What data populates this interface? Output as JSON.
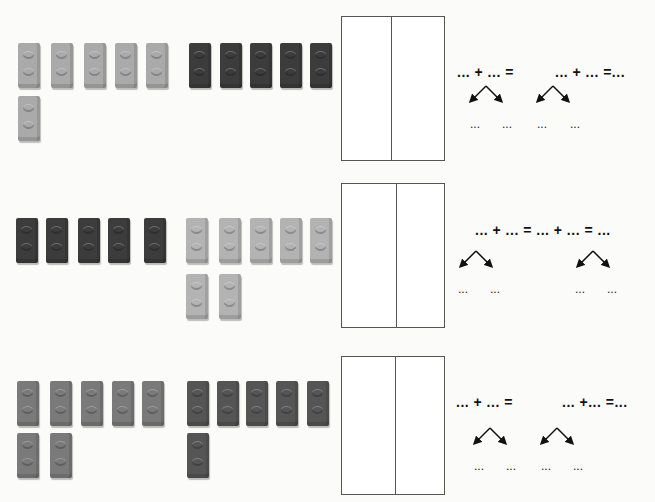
{
  "colors": {
    "light": "#aaaaaa",
    "dark": "#3c3c3c",
    "mid": "#7a7a7a",
    "mid_dark": "#555555",
    "light2": "#b3b3b3"
  },
  "exercises": [
    {
      "bricks": [
        {
          "x": 18,
          "y": 43,
          "c": "light"
        },
        {
          "x": 51,
          "y": 43,
          "c": "light"
        },
        {
          "x": 84,
          "y": 43,
          "c": "light"
        },
        {
          "x": 115,
          "y": 43,
          "c": "light"
        },
        {
          "x": 146,
          "y": 43,
          "c": "light"
        },
        {
          "x": 189,
          "y": 43,
          "c": "dark"
        },
        {
          "x": 220,
          "y": 43,
          "c": "dark"
        },
        {
          "x": 250,
          "y": 43,
          "c": "dark"
        },
        {
          "x": 280,
          "y": 43,
          "c": "dark"
        },
        {
          "x": 310,
          "y": 43,
          "c": "dark"
        },
        {
          "x": 18,
          "y": 96,
          "c": "light"
        }
      ],
      "groups": {
        "light_count": 6,
        "dark_count": 5
      },
      "box": {
        "x": 341,
        "y": 16,
        "w": 104,
        "h": 145,
        "mid": 49
      },
      "equation_left": "... + ... =",
      "equation_right": "... + ... =...",
      "eq_left_pos": {
        "x": 457,
        "y": 71
      },
      "eq_right_pos": {
        "x": 555,
        "y": 71
      },
      "arrows": [
        {
          "x": 470,
          "y": 85
        },
        {
          "x": 537,
          "y": 85
        }
      ],
      "blanks": [
        "...",
        "...",
        "...",
        "..."
      ],
      "blank_pos": [
        {
          "x": 470,
          "y": 125
        },
        {
          "x": 502,
          "y": 125
        },
        {
          "x": 537,
          "y": 125
        },
        {
          "x": 570,
          "y": 125
        }
      ]
    },
    {
      "bricks": [
        {
          "x": 16,
          "y": 218,
          "c": "dark"
        },
        {
          "x": 46,
          "y": 218,
          "c": "dark"
        },
        {
          "x": 78,
          "y": 218,
          "c": "dark"
        },
        {
          "x": 108,
          "y": 218,
          "c": "dark"
        },
        {
          "x": 144,
          "y": 218,
          "c": "dark"
        },
        {
          "x": 186,
          "y": 218,
          "c": "light2"
        },
        {
          "x": 219,
          "y": 218,
          "c": "light2"
        },
        {
          "x": 250,
          "y": 218,
          "c": "light2"
        },
        {
          "x": 280,
          "y": 218,
          "c": "light2"
        },
        {
          "x": 310,
          "y": 218,
          "c": "light2"
        },
        {
          "x": 186,
          "y": 274,
          "c": "light2"
        },
        {
          "x": 219,
          "y": 274,
          "c": "light2"
        }
      ],
      "groups": {
        "dark_count": 5,
        "light_count": 7
      },
      "box": {
        "x": 341,
        "y": 183,
        "w": 104,
        "h": 145,
        "mid": 54
      },
      "equation_full": "... + ... = ... + ... = ...",
      "eq_full_pos": {
        "x": 475,
        "y": 230
      },
      "arrows": [
        {
          "x": 460,
          "y": 250
        },
        {
          "x": 577,
          "y": 250
        }
      ],
      "blanks": [
        "...",
        "...",
        "...",
        "..."
      ],
      "blank_pos": [
        {
          "x": 458,
          "y": 290
        },
        {
          "x": 490,
          "y": 290
        },
        {
          "x": 575,
          "y": 290
        },
        {
          "x": 607,
          "y": 290
        }
      ]
    },
    {
      "bricks": [
        {
          "x": 17,
          "y": 381,
          "c": "mid"
        },
        {
          "x": 50,
          "y": 381,
          "c": "mid"
        },
        {
          "x": 81,
          "y": 381,
          "c": "mid"
        },
        {
          "x": 112,
          "y": 381,
          "c": "mid"
        },
        {
          "x": 142,
          "y": 381,
          "c": "mid"
        },
        {
          "x": 187,
          "y": 381,
          "c": "mid_dark"
        },
        {
          "x": 217,
          "y": 381,
          "c": "mid_dark"
        },
        {
          "x": 246,
          "y": 381,
          "c": "mid_dark"
        },
        {
          "x": 276,
          "y": 381,
          "c": "mid_dark"
        },
        {
          "x": 307,
          "y": 381,
          "c": "mid_dark"
        },
        {
          "x": 17,
          "y": 433,
          "c": "mid"
        },
        {
          "x": 50,
          "y": 433,
          "c": "mid"
        },
        {
          "x": 187,
          "y": 433,
          "c": "mid_dark"
        }
      ],
      "groups": {
        "left_count": 7,
        "right_count": 6
      },
      "box": {
        "x": 341,
        "y": 356,
        "w": 104,
        "h": 139,
        "mid": 53
      },
      "equation_left": "... + ... =",
      "equation_right": "... +... =...",
      "eq_left_pos": {
        "x": 456,
        "y": 401
      },
      "eq_right_pos": {
        "x": 562,
        "y": 401
      },
      "arrows": [
        {
          "x": 474,
          "y": 427
        },
        {
          "x": 541,
          "y": 427
        }
      ],
      "blanks": [
        "...",
        "...",
        "...",
        "..."
      ],
      "blank_pos": [
        {
          "x": 474,
          "y": 467
        },
        {
          "x": 506,
          "y": 467
        },
        {
          "x": 541,
          "y": 467
        },
        {
          "x": 573,
          "y": 467
        }
      ]
    }
  ]
}
